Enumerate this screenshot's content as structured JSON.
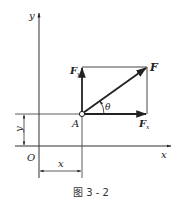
{
  "figure": {
    "caption": "图 3 - 2",
    "axes": {
      "x_label": "x",
      "y_label": "y",
      "origin_label": "O"
    },
    "point": {
      "label": "A"
    },
    "force": {
      "resultant_label": "F",
      "x_component_label": "F",
      "x_component_sub": "x",
      "y_component_label": "F",
      "y_component_sub": "y",
      "angle_label": "θ"
    },
    "dimensions": {
      "x_dim_label": "x",
      "y_dim_label": "y"
    },
    "colors": {
      "line": "#333333",
      "background": "#ffffff"
    }
  }
}
